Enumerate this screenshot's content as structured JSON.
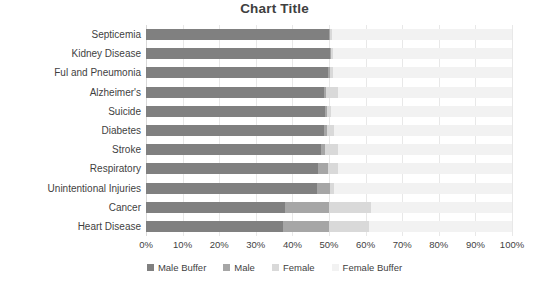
{
  "chart_data": {
    "type": "bar",
    "title": "Chart Title",
    "orientation": "horizontal",
    "stacked": true,
    "xlabel": "",
    "ylabel": "",
    "xlim": [
      0,
      100
    ],
    "grid": true,
    "legend_position": "bottom",
    "x_tick_labels": [
      "0%",
      "10%",
      "20%",
      "30%",
      "40%",
      "50%",
      "60%",
      "70%",
      "80%",
      "90%",
      "100%"
    ],
    "x_ticks": [
      0,
      10,
      20,
      30,
      40,
      50,
      60,
      70,
      80,
      90,
      100
    ],
    "categories": [
      "Septicemia",
      "Kidney Disease",
      "Ful and Pneumonia",
      "Alzheimer's",
      "Suicide",
      "Diabetes",
      "Stroke",
      "Respiratory",
      "Unintentional Injuries",
      "Cancer",
      "Heart Disease"
    ],
    "series": [
      {
        "name": "Male Buffer",
        "color": "#808080",
        "values": [
          50.0,
          50.2,
          49.8,
          48.5,
          48.8,
          48.6,
          47.8,
          46.9,
          46.6,
          38.0,
          37.5
        ]
      },
      {
        "name": "Male",
        "color": "#a6a6a6",
        "values": [
          0.3,
          0.4,
          0.5,
          0.6,
          0.6,
          0.8,
          1.1,
          2.9,
          3.6,
          12.0,
          12.5
        ]
      },
      {
        "name": "Female",
        "color": "#d9d9d9",
        "values": [
          0.4,
          0.5,
          0.7,
          3.4,
          1.1,
          2.1,
          3.6,
          2.7,
          1.3,
          11.5,
          11.0
        ]
      },
      {
        "name": "Female Buffer",
        "color": "#f2f2f2",
        "values": [
          49.3,
          48.9,
          49.0,
          47.5,
          49.5,
          48.5,
          47.5,
          47.5,
          48.5,
          38.5,
          39.0
        ]
      }
    ]
  }
}
